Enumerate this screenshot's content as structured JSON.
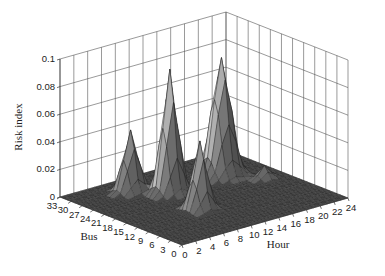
{
  "chart_data": {
    "type": "surface3d",
    "title": "",
    "xlabel": "Hour",
    "ylabel": "Bus",
    "zlabel": "Risk index",
    "x_ticks": [
      0,
      2,
      4,
      6,
      8,
      10,
      12,
      14,
      16,
      18,
      20,
      22,
      24
    ],
    "y_ticks": [
      0,
      3,
      6,
      9,
      12,
      15,
      18,
      21,
      24,
      27,
      30,
      33
    ],
    "z_ticks": [
      0,
      0.02,
      0.04,
      0.06,
      0.08,
      0.1
    ],
    "z_tick_labels": [
      "0",
      "0.02",
      "0.04",
      "0.06",
      "0.08",
      "0.1"
    ],
    "xlim": [
      0,
      24
    ],
    "ylim": [
      0,
      33
    ],
    "zlim": [
      0,
      0.1
    ],
    "grid": true,
    "colormap": "gray",
    "peaks": [
      {
        "name": "left-peak",
        "hour": 7,
        "bus": 27,
        "risk": 0.045,
        "sigma_hour": 0.9,
        "sigma_bus": 1.2
      },
      {
        "name": "tall-middle-peak",
        "hour": 10,
        "bus": 22,
        "risk": 0.09,
        "sigma_hour": 0.9,
        "sigma_bus": 1.3
      },
      {
        "name": "front-middle-peak",
        "hour": 9,
        "bus": 12,
        "risk": 0.05,
        "sigma_hour": 0.8,
        "sigma_bus": 1.3
      },
      {
        "name": "right-peak",
        "hour": 18,
        "bus": 23,
        "risk": 0.086,
        "sigma_hour": 1.1,
        "sigma_bus": 1.6
      },
      {
        "name": "small-bump",
        "hour": 21,
        "bus": 17,
        "risk": 0.01,
        "sigma_hour": 0.7,
        "sigma_bus": 1.0
      }
    ]
  }
}
